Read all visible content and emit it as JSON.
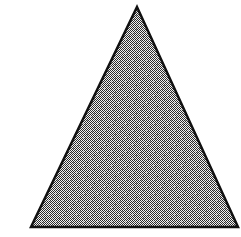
{
  "figure": {
    "type": "geometric-shape",
    "shape_name": "triangle",
    "canvas": {
      "width": 241,
      "height": 237,
      "background_color": "#ffffff"
    },
    "shape": {
      "name": "triangle",
      "sides": 3,
      "vertices": [
        {
          "label": "apex",
          "x": 137,
          "y": 7
        },
        {
          "label": "bottom-right",
          "x": 238,
          "y": 227
        },
        {
          "label": "bottom-left",
          "x": 31,
          "y": 227
        }
      ],
      "points_attr": "137,7 238,227 31,227",
      "base_width": 207,
      "height": 220,
      "stroke_color": "#111111",
      "stroke_width": 2.5,
      "fill_style": "dithered-halftone",
      "fill_color": "#989898",
      "fill_dark_pixel": "#2b2b2b",
      "fill_light_pixel": "#f2f2f2",
      "dither_cell_size": 2
    },
    "labels": [],
    "annotations": []
  }
}
